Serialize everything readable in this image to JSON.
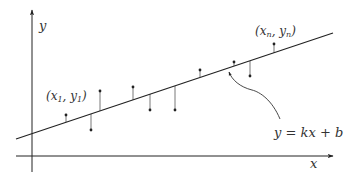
{
  "figure": {
    "axes": {
      "x_label": "x",
      "y_label": "y",
      "color": "#222222"
    },
    "line": {
      "equation": "y = kx + b",
      "color": "#222222",
      "x1": 16,
      "y1": 139,
      "x2": 333,
      "y2": 33
    },
    "labels": {
      "first_point": "(x₁, y₁)",
      "last_point": "(xₙ, yₙ)",
      "equation": "y = kx + b"
    },
    "colors": {
      "stroke": "#222222",
      "residual": "#555555",
      "text": "#333333",
      "background": "#ffffff"
    }
  },
  "chart_data": {
    "type": "scatter",
    "title": "",
    "xlabel": "x",
    "ylabel": "y",
    "annotation": "y = kx + b",
    "point_labels": [
      "(x1, y1)",
      "(xn, yn)"
    ],
    "grid": false,
    "points_px": [
      {
        "x": 66,
        "y": 115,
        "line_y": 122
      },
      {
        "x": 91,
        "y": 130,
        "line_y": 114
      },
      {
        "x": 100,
        "y": 91,
        "line_y": 111
      },
      {
        "x": 133,
        "y": 87,
        "line_y": 100
      },
      {
        "x": 150,
        "y": 110,
        "line_y": 94
      },
      {
        "x": 175,
        "y": 110,
        "line_y": 86
      },
      {
        "x": 200,
        "y": 70,
        "line_y": 77
      },
      {
        "x": 234,
        "y": 62,
        "line_y": 66
      },
      {
        "x": 250,
        "y": 76,
        "line_y": 61
      },
      {
        "x": 274,
        "y": 44,
        "line_y": 53
      }
    ]
  }
}
